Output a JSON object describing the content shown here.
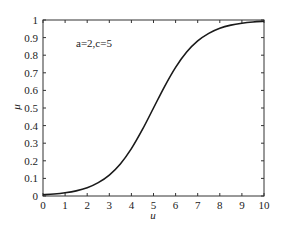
{
  "chart_data": {
    "type": "line",
    "title": "",
    "xlabel": "u",
    "ylabel": "μ",
    "xlim": [
      0,
      10
    ],
    "ylim": [
      0,
      1
    ],
    "grid": false,
    "legend": null,
    "annotation": "a=2,c=5",
    "x_ticks": [
      "0",
      "1",
      "2",
      "3",
      "4",
      "5",
      "6",
      "7",
      "8",
      "9",
      "10"
    ],
    "y_ticks": [
      "0",
      "0.1",
      "0.2",
      "0.3",
      "0.4",
      "0.5",
      "0.6",
      "0.7",
      "0.8",
      "0.9",
      "1"
    ],
    "series": [
      {
        "name": "membership",
        "x": [
          0,
          0.5,
          1,
          1.5,
          2,
          2.5,
          3,
          3.5,
          4,
          4.5,
          5,
          5.5,
          6,
          6.5,
          7,
          7.5,
          8,
          8.5,
          9,
          9.5,
          10
        ],
        "values": [
          0.007,
          0.011,
          0.018,
          0.029,
          0.047,
          0.076,
          0.119,
          0.182,
          0.269,
          0.378,
          0.5,
          0.622,
          0.731,
          0.818,
          0.881,
          0.924,
          0.953,
          0.971,
          0.982,
          0.989,
          0.993
        ]
      }
    ]
  }
}
